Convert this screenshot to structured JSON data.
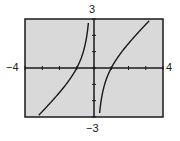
{
  "chart_data": {
    "type": "line",
    "title": "",
    "xlabel": "",
    "ylabel": "",
    "xlim": [
      -4,
      4
    ],
    "ylim": [
      -3,
      3
    ],
    "x_tick_labels": {
      "min": "−4",
      "max": "4"
    },
    "y_tick_labels": {
      "min": "−3",
      "max": "3"
    },
    "x_ticks": [
      -4,
      -3,
      -2,
      -1,
      0,
      1,
      2,
      3,
      4
    ],
    "y_ticks": [
      -3,
      -2,
      -1,
      0,
      1,
      2,
      3
    ],
    "grid": false,
    "background": "#d9d9d9",
    "series": [
      {
        "name": "f(x) = x - 1/x",
        "branch": "left",
        "x": [
          -3.2,
          -3,
          -2.5,
          -2,
          -1.5,
          -1,
          -0.8,
          -0.6,
          -0.5,
          -0.4,
          -0.33
        ],
        "y": [
          -2.89,
          -2.67,
          -2.1,
          -1.5,
          -0.83,
          0,
          0.45,
          1.07,
          1.5,
          2.1,
          2.7
        ]
      },
      {
        "name": "f(x) = x - 1/x",
        "branch": "right",
        "x": [
          0.33,
          0.4,
          0.5,
          0.6,
          0.8,
          1,
          1.5,
          2,
          2.5,
          3,
          3.2
        ],
        "y": [
          -2.7,
          -2.1,
          -1.5,
          -1.07,
          -0.45,
          0,
          0.83,
          1.5,
          2.1,
          2.67,
          2.89
        ]
      }
    ],
    "asymptotes": [
      {
        "type": "vertical",
        "x": 0
      }
    ],
    "legend": null
  },
  "labels": {
    "y_max": "3",
    "y_min": "−3",
    "x_min": "−4",
    "x_max": "4"
  }
}
